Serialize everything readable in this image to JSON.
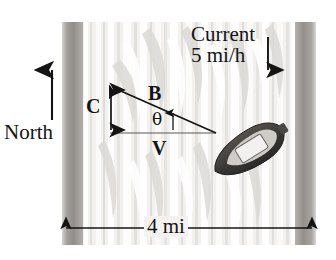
{
  "figure": {
    "type": "river-crossing-vector-diagram",
    "river_width_label": "4 mi",
    "compass_label": "North",
    "current": {
      "label_line1": "Current",
      "label_line2": "5 mi/h",
      "direction": "down",
      "speed_value": 5,
      "speed_units": "mi/h"
    },
    "vectors": [
      {
        "id": "B",
        "label": "B",
        "name": "boat-velocity-vector",
        "description": "diagonal up-left resultant heading"
      },
      {
        "id": "C",
        "label": "C",
        "name": "current-vector",
        "description": "vertical downward current component"
      },
      {
        "id": "V",
        "label": "V",
        "name": "velocity-vector",
        "description": "horizontal across-river component"
      }
    ],
    "angle": {
      "symbol": "θ",
      "name": "theta-angle"
    },
    "boat": {
      "name": "boat",
      "heading_degrees": -32
    },
    "colors": {
      "bank": "#8f8d8a",
      "water": "#efeeec",
      "ink": "#141414",
      "boat_hull": "#3d3c3a",
      "boat_deck": "#dedcd8"
    }
  }
}
